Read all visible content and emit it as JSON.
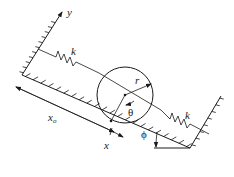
{
  "diagram": {
    "labels": {
      "y_axis": "y",
      "x_axis": "x",
      "spring_left": "k",
      "spring_right": "k",
      "radius": "r",
      "theta": "θ",
      "phi": "ϕ",
      "x_origin": "x",
      "x_origin_sub": "o"
    },
    "colors": {
      "stroke": "#1a1a1a",
      "background": "#ffffff"
    }
  }
}
